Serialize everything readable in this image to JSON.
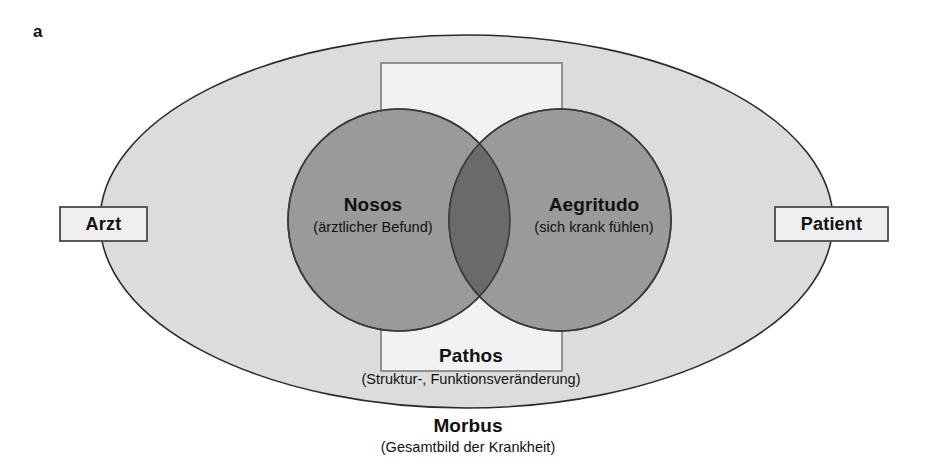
{
  "figure": {
    "panel_letter": "a",
    "ellipse_label": {
      "title": "Morbus",
      "subtitle": "(Gesamtbild der Krankheit)"
    },
    "rectangle_label": {
      "title": "Pathos",
      "subtitle": "(Struktur-, Funktionsveränderung)"
    },
    "circles": [
      {
        "id": "nosos",
        "title": "Nosos",
        "subtitle": "(ärztlicher Befund)"
      },
      {
        "id": "aegritudo",
        "title": "Aegritudo",
        "subtitle": "(sich krank fühlen)"
      }
    ],
    "side_boxes": [
      {
        "id": "arzt",
        "label": "Arzt"
      },
      {
        "id": "patient",
        "label": "Patient"
      }
    ],
    "colors": {
      "background": "#ffffff",
      "ellipse_fill": "#dcdcdc",
      "ellipse_stroke": "#2b2b2b",
      "rectangle_fill": "#f2f2f2",
      "rectangle_stroke": "#7a7a7a",
      "circle_fill": "#9a9a9a",
      "circle_stroke": "#3a3a3a",
      "overlap_fill": "#6a6a6a",
      "box_fill": "#efefef",
      "box_stroke": "#4a4a4a",
      "text": "#111111"
    }
  }
}
